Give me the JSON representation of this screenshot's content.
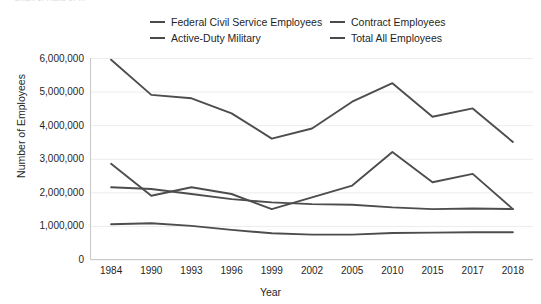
{
  "clipped_title": "Chart 1. Ratio of ...",
  "legend": {
    "items": [
      {
        "label": "Federal Civil Service Employees",
        "color": "#4d4d4d",
        "column": "a"
      },
      {
        "label": "Contract Employees",
        "color": "#4d4d4d",
        "column": "b"
      },
      {
        "label": "Active-Duty Military",
        "color": "#4d4d4d",
        "column": "a"
      },
      {
        "label": "Total All Employees",
        "color": "#4d4d4d",
        "column": "b"
      }
    ]
  },
  "axes": {
    "x_title": "Year",
    "y_title": "Number of Employees",
    "y_ticks": [
      "0",
      "1,000,000",
      "2,000,000",
      "3,000,000",
      "4,000,000",
      "5,000,000",
      "6,000,000"
    ],
    "x_ticks": [
      "1984",
      "1990",
      "1993",
      "1996",
      "1999",
      "2002",
      "2005",
      "2010",
      "2015",
      "2017",
      "2018"
    ]
  },
  "chart_data": {
    "type": "line",
    "title": "",
    "xlabel": "Year",
    "ylabel": "Number of Employees",
    "categories": [
      "1984",
      "1990",
      "1993",
      "1996",
      "1999",
      "2002",
      "2005",
      "2010",
      "2015",
      "2017",
      "2018"
    ],
    "ylim": [
      0,
      6000000
    ],
    "ytick_values": [
      0,
      1000000,
      2000000,
      3000000,
      4000000,
      5000000,
      6000000
    ],
    "grid": true,
    "legend_position": "top",
    "series": [
      {
        "name": "Total All Employees",
        "color": "#4d4d4d",
        "values": [
          5950000,
          4900000,
          4800000,
          4350000,
          3600000,
          3900000,
          4700000,
          5250000,
          4250000,
          4500000,
          3500000
        ]
      },
      {
        "name": "Contract Employees",
        "color": "#4d4d4d",
        "values": [
          2850000,
          1900000,
          2150000,
          1950000,
          1500000,
          1850000,
          2200000,
          3200000,
          2300000,
          2550000,
          1500000
        ]
      },
      {
        "name": "Federal Civil Service Employees",
        "color": "#4d4d4d",
        "values": [
          2150000,
          2100000,
          1950000,
          1800000,
          1700000,
          1650000,
          1630000,
          1550000,
          1500000,
          1520000,
          1500000
        ]
      },
      {
        "name": "Active-Duty Military",
        "color": "#4d4d4d",
        "values": [
          1050000,
          1080000,
          1000000,
          880000,
          780000,
          740000,
          740000,
          790000,
          800000,
          810000,
          810000
        ]
      }
    ]
  }
}
